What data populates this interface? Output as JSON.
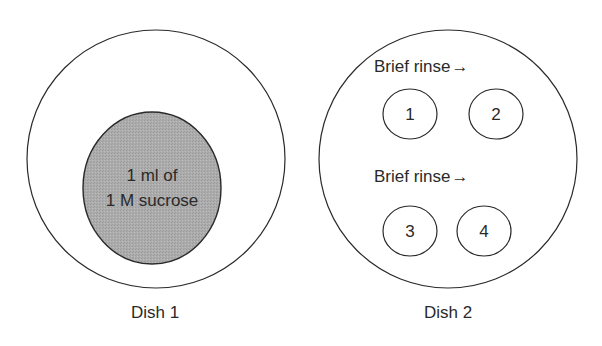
{
  "colors": {
    "stroke": "#2a2a2a",
    "sucrose_fill": "#a9a9a9",
    "background": "#ffffff"
  },
  "dish1": {
    "label": "Dish 1",
    "drop": {
      "line1": "1 ml of",
      "line2": "1 M sucrose"
    }
  },
  "dish2": {
    "label": "Dish 2",
    "rinse_top": "Brief rinse",
    "rinse_bottom": "Brief rinse",
    "arrow_icon": "→",
    "wells": [
      "1",
      "2",
      "3",
      "4"
    ]
  }
}
